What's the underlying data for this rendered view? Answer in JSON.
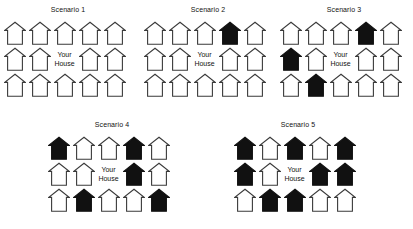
{
  "figure": {
    "background_color": "#ffffff",
    "house_outline_color": "#3a3a3a",
    "house_filled_color": "#111111",
    "house_empty_color": "#ffffff",
    "your_house_label_line1": "Your",
    "your_house_label_line2": "House",
    "icon_names": {
      "empty_house": "house-outline-icon",
      "filled_house": "house-filled-icon"
    }
  },
  "scenarios": [
    {
      "id": "scenario-1",
      "title": "Scenario 1",
      "left": 2,
      "top": 6,
      "width": 132,
      "rows": [
        [
          "empty",
          "empty",
          "empty",
          "empty",
          "empty"
        ],
        [
          "empty",
          "empty",
          "your_house",
          "empty",
          "empty"
        ],
        [
          "empty",
          "empty",
          "empty",
          "empty",
          "empty"
        ]
      ],
      "filled_count": 0
    },
    {
      "id": "scenario-2",
      "title": "Scenario 2",
      "left": 142,
      "top": 6,
      "width": 132,
      "rows": [
        [
          "empty",
          "empty",
          "empty",
          "filled",
          "empty"
        ],
        [
          "empty",
          "empty",
          "your_house",
          "empty",
          "empty"
        ],
        [
          "empty",
          "empty",
          "empty",
          "empty",
          "empty"
        ]
      ],
      "filled_count": 1
    },
    {
      "id": "scenario-3",
      "title": "Scenario 3",
      "left": 278,
      "top": 6,
      "width": 132,
      "rows": [
        [
          "empty",
          "empty",
          "empty",
          "filled",
          "empty"
        ],
        [
          "filled",
          "empty",
          "your_house",
          "empty",
          "empty"
        ],
        [
          "empty",
          "filled",
          "empty",
          "empty",
          "empty"
        ]
      ],
      "filled_count": 3
    },
    {
      "id": "scenario-4",
      "title": "Scenario 4",
      "left": 46,
      "top": 121,
      "width": 132,
      "rows": [
        [
          "filled",
          "empty",
          "empty",
          "filled",
          "empty"
        ],
        [
          "empty",
          "empty",
          "your_house",
          "filled",
          "empty"
        ],
        [
          "empty",
          "filled",
          "empty",
          "empty",
          "filled"
        ]
      ],
      "filled_count": 6
    },
    {
      "id": "scenario-5",
      "title": "Scenario 5",
      "left": 232,
      "top": 121,
      "width": 132,
      "rows": [
        [
          "filled",
          "empty",
          "filled",
          "empty",
          "filled"
        ],
        [
          "filled",
          "empty",
          "your_house",
          "filled",
          "filled"
        ],
        [
          "empty",
          "filled",
          "filled",
          "empty",
          "empty"
        ]
      ],
      "filled_count": 8
    }
  ]
}
